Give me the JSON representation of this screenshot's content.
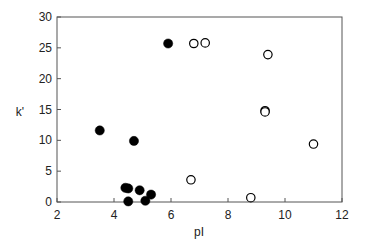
{
  "chart_data": {
    "type": "scatter",
    "title": "",
    "xlabel": "pI",
    "ylabel": "k'",
    "xlim": [
      2,
      12
    ],
    "ylim": [
      0,
      30
    ],
    "xticks": [
      2,
      4,
      6,
      8,
      10,
      12
    ],
    "yticks": [
      0,
      5,
      10,
      15,
      20,
      25,
      30
    ],
    "grid": false,
    "legend": null,
    "series": [
      {
        "name": "filled",
        "marker": "filled-circle",
        "color": "#000000",
        "points": [
          {
            "x": 3.5,
            "y": 11.6
          },
          {
            "x": 4.7,
            "y": 9.9
          },
          {
            "x": 5.9,
            "y": 25.7
          },
          {
            "x": 4.4,
            "y": 2.3
          },
          {
            "x": 4.5,
            "y": 2.2
          },
          {
            "x": 4.5,
            "y": 0.1
          },
          {
            "x": 4.9,
            "y": 1.9
          },
          {
            "x": 5.1,
            "y": 0.2
          },
          {
            "x": 5.3,
            "y": 1.2
          }
        ]
      },
      {
        "name": "open",
        "marker": "open-circle",
        "color": "#000000",
        "points": [
          {
            "x": 6.8,
            "y": 25.7
          },
          {
            "x": 7.2,
            "y": 25.8
          },
          {
            "x": 9.4,
            "y": 23.9
          },
          {
            "x": 9.3,
            "y": 14.8
          },
          {
            "x": 9.3,
            "y": 14.6
          },
          {
            "x": 11.0,
            "y": 9.4
          },
          {
            "x": 6.7,
            "y": 3.6
          },
          {
            "x": 8.8,
            "y": 0.7
          }
        ]
      }
    ]
  }
}
